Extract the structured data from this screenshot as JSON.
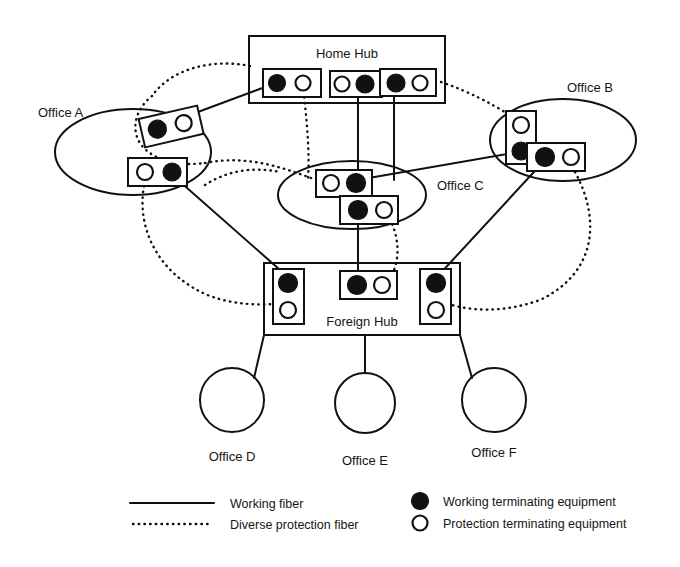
{
  "figure": {
    "type": "network-diagram",
    "title_visible": false,
    "background_color": "#ffffff",
    "line_color": "#111111"
  },
  "nodes": {
    "home_hub": {
      "label": "Home Hub",
      "shape": "rectangle",
      "x": 249,
      "y": 36,
      "w": 196,
      "h": 67,
      "label_x": 347,
      "label_y": 56
    },
    "foreign_hub": {
      "label": "Foreign Hub",
      "shape": "rectangle",
      "x": 264,
      "y": 263,
      "w": 196,
      "h": 72,
      "label_x": 362,
      "label_y": 326
    },
    "office_a": {
      "label": "Office A",
      "shape": "ellipse",
      "cx": 133,
      "cy": 152,
      "rx": 78,
      "ry": 43,
      "label_x": 38,
      "label_y": 113
    },
    "office_b": {
      "label": "Office B",
      "shape": "ellipse",
      "cx": 563,
      "cy": 140,
      "rx": 73,
      "ry": 41,
      "label_x": 567,
      "label_y": 90
    },
    "office_c": {
      "label": "Office C",
      "shape": "ellipse",
      "cx": 352,
      "cy": 195,
      "rx": 74,
      "ry": 34,
      "label_x": 437,
      "label_y": 188
    },
    "office_d": {
      "label": "Office D",
      "shape": "circle",
      "cx": 232,
      "cy": 400,
      "r": 32,
      "label_x": 232,
      "label_y": 457
    },
    "office_e": {
      "label": "Office E",
      "shape": "circle",
      "cx": 365,
      "cy": 403,
      "r": 30,
      "label_x": 365,
      "label_y": 461
    },
    "office_f": {
      "label": "Office F",
      "shape": "circle",
      "cx": 494,
      "cy": 400,
      "r": 32,
      "label_x": 494,
      "label_y": 453
    }
  },
  "equipment_boxes": [
    {
      "id": "hh-box-1",
      "parent": "home_hub",
      "orientation": "horizontal",
      "x": 263,
      "y": 69,
      "w": 58,
      "h": 28,
      "items": [
        "working",
        "protection"
      ]
    },
    {
      "id": "hh-box-2",
      "parent": "home_hub",
      "orientation": "horizontal",
      "x": 330,
      "y": 71,
      "w": 52,
      "h": 26,
      "items": [
        "protection",
        "working"
      ]
    },
    {
      "id": "hh-box-3",
      "parent": "home_hub",
      "orientation": "horizontal",
      "x": 380,
      "y": 69,
      "w": 56,
      "h": 27,
      "items": [
        "working",
        "protection"
      ]
    },
    {
      "id": "oa-box-1",
      "parent": "office_a",
      "orientation": "horizontal-tilted",
      "x": 141,
      "y": 112,
      "w": 60,
      "h": 29,
      "rotate": -12,
      "items": [
        "working",
        "protection"
      ]
    },
    {
      "id": "oa-box-2",
      "parent": "office_a",
      "orientation": "horizontal",
      "x": 128,
      "y": 158,
      "w": 59,
      "h": 28,
      "items": [
        "protection",
        "working"
      ]
    },
    {
      "id": "ob-box-1",
      "parent": "office_b",
      "orientation": "vertical",
      "x": 506,
      "y": 111,
      "w": 30,
      "h": 53,
      "items": [
        "protection",
        "working"
      ]
    },
    {
      "id": "ob-box-2",
      "parent": "office_b",
      "orientation": "horizontal",
      "x": 527,
      "y": 143,
      "w": 58,
      "h": 28,
      "items": [
        "working",
        "protection"
      ]
    },
    {
      "id": "oc-box-1",
      "parent": "office_c",
      "orientation": "horizontal",
      "x": 316,
      "y": 170,
      "w": 56,
      "h": 27,
      "items": [
        "protection",
        "working"
      ]
    },
    {
      "id": "oc-box-2",
      "parent": "office_c",
      "orientation": "horizontal",
      "x": 340,
      "y": 196,
      "w": 58,
      "h": 28,
      "items": [
        "working",
        "protection"
      ]
    },
    {
      "id": "fh-box-1",
      "parent": "foreign_hub",
      "orientation": "vertical",
      "x": 273,
      "y": 269,
      "w": 31,
      "h": 55,
      "items": [
        "working",
        "protection"
      ]
    },
    {
      "id": "fh-box-2",
      "parent": "foreign_hub",
      "orientation": "horizontal",
      "x": 340,
      "y": 271,
      "w": 57,
      "h": 28,
      "items": [
        "working",
        "protection"
      ]
    },
    {
      "id": "fh-box-3",
      "parent": "foreign_hub",
      "orientation": "vertical",
      "x": 420,
      "y": 269,
      "w": 31,
      "h": 55,
      "items": [
        "working",
        "protection"
      ]
    }
  ],
  "legend": {
    "items": [
      {
        "key": "working-fiber",
        "style": "solid-line",
        "label": "Working fiber"
      },
      {
        "key": "diverse-protection-fiber",
        "style": "dotted-line",
        "label": "Diverse protection fiber"
      },
      {
        "key": "working-terminating-equipment",
        "style": "filled-circle",
        "label": "Working terminating equipment"
      },
      {
        "key": "protection-terminating-equipment",
        "style": "open-circle",
        "label": "Protection terminating equipment"
      }
    ],
    "left_line_x1": 130,
    "left_line_x2": 214,
    "text_left_x": 230,
    "marker_right_x": 420,
    "text_right_x": 443,
    "row1_y": 503,
    "row2_y": 524
  },
  "colors": {
    "stroke": "#111111",
    "fill_working": "#111111",
    "fill_protection": "#ffffff",
    "background": "#ffffff"
  }
}
